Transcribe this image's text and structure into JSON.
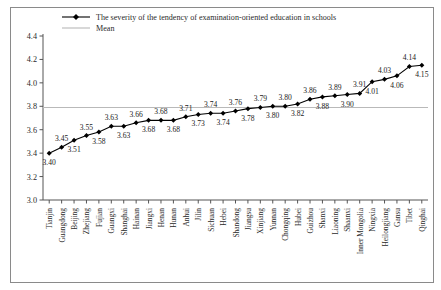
{
  "chart_data": {
    "type": "line",
    "title": "",
    "xlabel": "",
    "ylabel": "",
    "ylim": [
      3.0,
      4.4
    ],
    "yticks": [
      "3.0",
      "3.2",
      "3.4",
      "3.6",
      "3.8",
      "4.0",
      "4.2",
      "4.4"
    ],
    "ytick_values": [
      3.0,
      3.2,
      3.4,
      3.6,
      3.8,
      4.0,
      4.2,
      4.4
    ],
    "grid": false,
    "legend_position": "top",
    "legend": [
      {
        "label": "The severity of the tendency of examination-oriented education in schools",
        "marker": "diamond",
        "color": "#000000"
      },
      {
        "label": "Mean",
        "marker": "line",
        "color": "#b9b9b9"
      }
    ],
    "categories": [
      "Tianjin",
      "Guangdong",
      "Beijing",
      "Zhejiang",
      "Fujian",
      "Guangxi",
      "Shanghai",
      "Hainan",
      "Jiangxi",
      "Henan",
      "Hunan",
      "Anhui",
      "Jilin",
      "Sichuan",
      "Hebei",
      "Shandong",
      "Jiangsu",
      "Xinjiang",
      "Yunnan",
      "Chongqing",
      "Hubei",
      "Guizhou",
      "Shanxi",
      "Liaoning",
      "Shaanxi",
      "Inner Mongolia",
      "Ningxia",
      "Heilongjiang",
      "Gansu",
      "Tibet",
      "Qinghai"
    ],
    "values": [
      3.4,
      3.45,
      3.51,
      3.55,
      3.58,
      3.63,
      3.63,
      3.66,
      3.68,
      3.68,
      3.68,
      3.71,
      3.73,
      3.74,
      3.74,
      3.76,
      3.78,
      3.79,
      3.8,
      3.8,
      3.82,
      3.86,
      3.88,
      3.89,
      3.9,
      3.91,
      4.01,
      4.03,
      4.06,
      4.14,
      4.15
    ],
    "value_labels": [
      "3.40",
      "3.45",
      "3.51",
      "3.55",
      "3.58",
      "3.63",
      "3.63",
      "3.66",
      "3.68",
      "3.68",
      "3.68",
      "3.71",
      "3.73",
      "3.74",
      "3.74",
      "3.76",
      "3.78",
      "3.79",
      "3.80",
      "3.80",
      "3.82",
      "3.86",
      "3.88",
      "3.89",
      "3.90",
      "3.91",
      "4.01",
      "4.03",
      "4.06",
      "4.14",
      "4.15"
    ],
    "label_positions": [
      "below",
      "above",
      "below",
      "above",
      "below",
      "above",
      "below",
      "above",
      "below",
      "above",
      "below",
      "above",
      "below",
      "above",
      "below",
      "above",
      "below",
      "above",
      "below",
      "above",
      "below",
      "above",
      "below",
      "above",
      "below",
      "above",
      "below",
      "above",
      "below",
      "above",
      "below"
    ],
    "mean_line": {
      "label": "Mean",
      "value": 3.79,
      "color": "#b9b9b9"
    },
    "series_color": "#000000",
    "axis_color": "#555555"
  }
}
